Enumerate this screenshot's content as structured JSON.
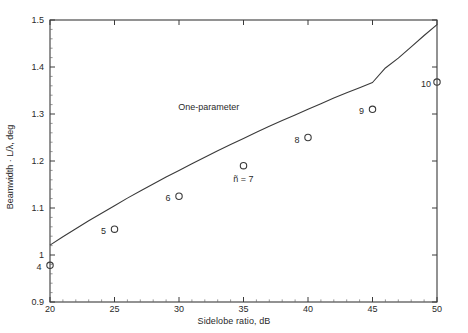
{
  "chart_data": {
    "type": "scatter",
    "title": "",
    "xlabel": "Sidelobe ratio, dB",
    "ylabel": "Beamwidth · L/λ, deg",
    "xlim": [
      20,
      50
    ],
    "ylim": [
      0.9,
      1.5
    ],
    "xticks": [
      20,
      25,
      30,
      35,
      40,
      45,
      50
    ],
    "xticklabels": [
      "20",
      "25",
      "30",
      "35",
      "40",
      "45",
      "50"
    ],
    "yticks": [
      0.9,
      1.0,
      1.1,
      1.2,
      1.3,
      1.4,
      1.5
    ],
    "yticklabels": [
      "0.9",
      "1",
      "1.1",
      "1.2",
      "1.3",
      "1.4",
      "1.5"
    ],
    "xminor_interval": 1,
    "yminor_interval": 0.02,
    "grid": false,
    "legend": "none",
    "line_color": "#3a3a3a",
    "marker_color": "#3a3a3a",
    "series": [
      {
        "name": "One-parameter",
        "type": "line",
        "annotation": "One-parameter",
        "annotation_x": 32.3,
        "annotation_y": 1.315,
        "x": [
          20,
          21,
          22,
          23,
          24,
          25,
          26,
          27,
          28,
          29,
          30,
          31,
          32,
          33,
          34,
          35,
          36,
          37,
          38,
          39,
          40,
          41,
          42,
          43,
          44,
          45,
          46,
          47,
          48,
          49,
          50
        ],
        "y": [
          1.021,
          1.039,
          1.056,
          1.073,
          1.089,
          1.105,
          1.121,
          1.136,
          1.151,
          1.166,
          1.18,
          1.194,
          1.208,
          1.222,
          1.235,
          1.248,
          1.261,
          1.274,
          1.286,
          1.298,
          1.31,
          1.322,
          1.334,
          1.345,
          1.356,
          1.367,
          1.398,
          1.419,
          1.443,
          1.467,
          1.49
        ]
      },
      {
        "name": "Taylor n-bar points",
        "type": "scatter",
        "marker": "open-circle",
        "points": [
          {
            "label": "4",
            "x": 20,
            "y": 0.978,
            "label_pos": "left"
          },
          {
            "label": "5",
            "x": 25,
            "y": 1.055,
            "label_pos": "left"
          },
          {
            "label": "6",
            "x": 30,
            "y": 1.125,
            "label_pos": "left"
          },
          {
            "label": "ñ = 7",
            "x": 35,
            "y": 1.19,
            "label_pos": "below"
          },
          {
            "label": "8",
            "x": 40,
            "y": 1.25,
            "label_pos": "left"
          },
          {
            "label": "9",
            "x": 45,
            "y": 1.31,
            "label_pos": "left"
          },
          {
            "label": "10",
            "x": 50,
            "y": 1.368,
            "label_pos": "left"
          }
        ]
      }
    ]
  }
}
